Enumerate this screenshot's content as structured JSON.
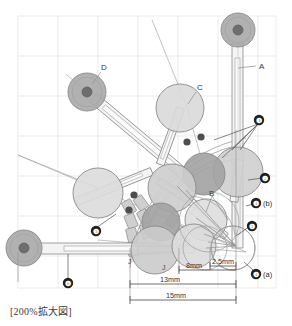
{
  "figure": {
    "caption": "[200%拡大図]",
    "background_color": "#ffffff",
    "grid_color": "#e4e4e4",
    "line_color": "#8f8f8f"
  },
  "labels": {
    "A": "A",
    "B": "B",
    "C": "C",
    "D": "D",
    "J1": "J",
    "J2": "J"
  },
  "callouts": [
    {
      "id": "c1",
      "num": "❶",
      "suffix": ""
    },
    {
      "id": "c2",
      "num": "❷",
      "suffix": ""
    },
    {
      "id": "c3",
      "num": "❸",
      "suffix": ""
    },
    {
      "id": "c4b",
      "num": "❹",
      "suffix": "(b)"
    },
    {
      "id": "c4a",
      "num": "❹",
      "suffix": "(a)"
    },
    {
      "id": "c5",
      "num": "❺",
      "suffix": ""
    },
    {
      "id": "c6",
      "num": "❻",
      "suffix": ""
    }
  ],
  "dimensions": [
    {
      "id": "d-2p5",
      "label": "2.5mm"
    },
    {
      "id": "d-8",
      "label": "8mm"
    },
    {
      "id": "d-13",
      "label": "13mm"
    },
    {
      "id": "d-15",
      "label": "15mm"
    }
  ],
  "chart_data": {
    "type": "scatter",
    "title": "",
    "note": "Mechanical linkage / sphere-packing technical drawing, 200% enlarged view",
    "colors": {
      "sphere_dark": "#9a9a9a",
      "sphere_mid": "#b9b9b9",
      "sphere_light": "#d6d6d6",
      "sphere_pale": "#e2e2e2",
      "hub_core": "#6e6e6e",
      "outline": "#8a8a8a",
      "dot_black": "#4b4b4b"
    },
    "spheres": [
      {
        "name": "pivot-A-hub",
        "cx": 238,
        "cy": 30,
        "r": 17,
        "fill": "#a9a9a9",
        "core": 5
      },
      {
        "name": "pivot-D-hub",
        "cx": 87,
        "cy": 92,
        "r": 19,
        "fill": "#a9a9a9",
        "core": 5
      },
      {
        "name": "pivot-6-hub",
        "cx": 24,
        "cy": 248,
        "r": 18,
        "fill": "#a9a9a9",
        "core": 5
      },
      {
        "name": "sphere-C",
        "cx": 180,
        "cy": 108,
        "r": 24,
        "fill": "#d9d9d9",
        "core": 0
      },
      {
        "name": "sphere-5",
        "cx": 98,
        "cy": 193,
        "r": 25,
        "fill": "#dcdcdc",
        "core": 0
      },
      {
        "name": "sphere-3r",
        "cx": 238,
        "cy": 172,
        "r": 25,
        "fill": "#cfcfcf",
        "core": 0
      },
      {
        "name": "sphere-3m",
        "cx": 204,
        "cy": 174,
        "r": 21,
        "fill": "#a2a2a2",
        "core": 0
      },
      {
        "name": "sphere-mid-l",
        "cx": 172,
        "cy": 188,
        "r": 24,
        "fill": "#cdcdcd",
        "core": 0
      },
      {
        "name": "sphere-dark2",
        "cx": 161,
        "cy": 222,
        "r": 19,
        "fill": "#a2a2a2",
        "core": 0
      },
      {
        "name": "sphere-low-l",
        "cx": 155,
        "cy": 250,
        "r": 24,
        "fill": "#cbcbcb",
        "core": 0
      },
      {
        "name": "sphere-B",
        "cx": 206,
        "cy": 220,
        "r": 21,
        "fill": "#dedede",
        "core": 0
      },
      {
        "name": "sphere-low-r",
        "cx": 194,
        "cy": 246,
        "r": 22,
        "fill": "#dcdcdc",
        "core": 0
      },
      {
        "name": "sphere-ghost",
        "cx": 233,
        "cy": 248,
        "r": 22,
        "fill": "none",
        "core": 0
      }
    ],
    "axis_ranges": {
      "x": [
        0,
        292
      ],
      "y": [
        0,
        326
      ]
    },
    "grid": true,
    "legend": "none"
  }
}
